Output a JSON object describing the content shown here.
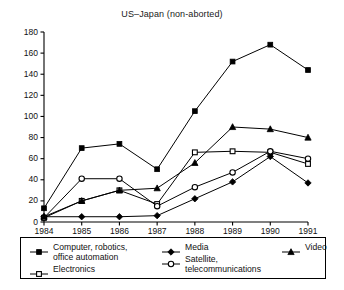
{
  "chart_data": {
    "type": "line",
    "title": "US–Japan (non-aborted)",
    "xlabel": "",
    "ylabel": "",
    "x": [
      1984,
      1985,
      1986,
      1987,
      1988,
      1989,
      1990,
      1991
    ],
    "categories": [
      "1984",
      "1985",
      "1986",
      "1987",
      "1988",
      "1989",
      "1990",
      "1991"
    ],
    "xlim": [
      1984,
      1991
    ],
    "ylim": [
      0,
      180
    ],
    "yticks": [
      0,
      20,
      40,
      60,
      80,
      100,
      120,
      140,
      160,
      180
    ],
    "grid": false,
    "legend_position": "below-axes",
    "series": [
      {
        "name": "Computer, robotics, office automation",
        "marker": "filled-square",
        "values": [
          13,
          70,
          74,
          50,
          105,
          152,
          168,
          144
        ]
      },
      {
        "name": "Electronics",
        "marker": "open-square",
        "values": [
          4,
          20,
          30,
          17,
          66,
          67,
          66,
          55
        ]
      },
      {
        "name": "Media",
        "marker": "filled-diamond",
        "values": [
          5,
          5,
          5,
          6,
          22,
          38,
          62,
          37
        ]
      },
      {
        "name": "Satellite, telecommunications",
        "marker": "open-circle",
        "values": [
          4,
          41,
          41,
          15,
          33,
          47,
          67,
          60
        ]
      },
      {
        "name": "Video",
        "marker": "filled-triangle",
        "values": [
          5,
          20,
          30,
          32,
          56,
          90,
          88,
          80
        ]
      }
    ]
  },
  "legend": {
    "columns": [
      {
        "entries": [
          {
            "marker": "filled-square",
            "line1": "Computer, robotics,",
            "line2": "office automation"
          },
          {
            "marker": "open-square",
            "line1": "Electronics",
            "line2": ""
          }
        ]
      },
      {
        "entries": [
          {
            "marker": "filled-diamond",
            "line1": "Media",
            "line2": ""
          },
          {
            "marker": "open-circle",
            "line1": "Satellite,",
            "line2": "telecommunications"
          }
        ]
      },
      {
        "entries": [
          {
            "marker": "filled-triangle",
            "line1": "Video",
            "line2": ""
          }
        ]
      }
    ]
  },
  "colors": {
    "line": "#000000",
    "axis": "#000000",
    "background": "#ffffff",
    "text": "#111111"
  }
}
